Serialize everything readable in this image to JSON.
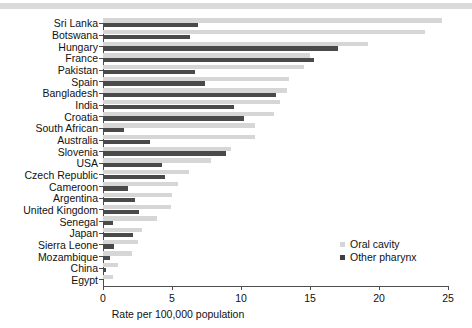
{
  "chart_data": {
    "type": "bar",
    "orientation": "horizontal",
    "title": "",
    "xlabel": "Rate per 100,000 population",
    "ylabel": "",
    "xlim": [
      0,
      25
    ],
    "xticks": [
      0,
      5,
      10,
      15,
      20,
      25
    ],
    "grid": false,
    "legend_position": "inside-right",
    "categories": [
      "Sri Lanka",
      "Botswana",
      "Hungary",
      "France",
      "Pakistan",
      "Spain",
      "Bangladesh",
      "India",
      "Croatia",
      "South African",
      "Australia",
      "Slovenia",
      "USA",
      "Czech Republic",
      "Cameroon",
      "Argentina",
      "United Kingdom",
      "Senegal",
      "Japan",
      "Sierra Leone",
      "Mozambique",
      "China",
      "Egypt"
    ],
    "series": [
      {
        "name": "Oral cavity",
        "color": "#d6d6d6",
        "values": [
          24.6,
          23.3,
          19.2,
          15.0,
          14.6,
          13.5,
          13.3,
          12.8,
          12.4,
          11.0,
          11.0,
          9.3,
          7.8,
          6.2,
          5.4,
          5.0,
          4.9,
          3.9,
          2.8,
          2.5,
          2.1,
          1.1,
          0.7
        ]
      },
      {
        "name": "Other pharynx",
        "color": "#4a4a4a",
        "values": [
          6.9,
          6.3,
          17.0,
          15.3,
          6.7,
          7.4,
          12.5,
          9.5,
          10.2,
          1.5,
          3.4,
          8.9,
          4.3,
          4.5,
          1.8,
          2.3,
          2.6,
          0.75,
          2.2,
          0.8,
          0.5,
          0.25,
          0.1
        ]
      }
    ]
  },
  "legend": {
    "items": [
      {
        "label": "Oral cavity",
        "swatch": "light"
      },
      {
        "label": "Other pharynx",
        "swatch": "dark"
      }
    ]
  },
  "colors": {
    "oral_cavity": "#d6d6d6",
    "other_pharynx": "#4a4a4a",
    "axis": "#4d4d4d",
    "top_band": "#d3d3d3"
  }
}
